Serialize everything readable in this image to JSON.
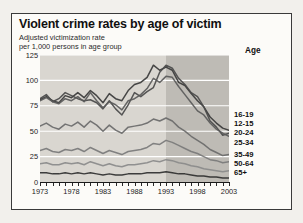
{
  "figure": {
    "title": "Violent crime rates by age of victim",
    "subtitle_line1": "Adjusted victimization rate",
    "subtitle_line2": "per 1,000 persons in age group",
    "legend_title": "Age"
  },
  "chart_data": {
    "type": "line",
    "title": "Violent crime rates by age of victim",
    "subtitle": "Adjusted victimization rate per 1,000 persons in age group",
    "xlabel": "",
    "ylabel": "Adjusted victimization rate per 1,000 persons in age group",
    "xlim": [
      1973,
      2003
    ],
    "ylim": [
      0,
      125
    ],
    "yticks": [
      0,
      25,
      50,
      75,
      100,
      125
    ],
    "xticks": [
      1973,
      1978,
      1983,
      1988,
      1993,
      1998,
      2003
    ],
    "xtick_labels": [
      "1973",
      "1978",
      "1983",
      "1988",
      "1993",
      "1998",
      "2003"
    ],
    "ytick_labels": [
      "0",
      "25",
      "50",
      "75",
      "100",
      "125"
    ],
    "grid": true,
    "grid_color": "#ffffff",
    "legend_position": "right",
    "legend_title": "Age",
    "plot_background": "#d9d6d0",
    "shaded_region": {
      "from": 1993,
      "to": 2003,
      "color": "#b9b6b0"
    },
    "x": [
      1973,
      1974,
      1975,
      1976,
      1977,
      1978,
      1979,
      1980,
      1981,
      1982,
      1983,
      1984,
      1985,
      1986,
      1987,
      1988,
      1989,
      1990,
      1991,
      1992,
      1993,
      1994,
      1995,
      1996,
      1997,
      1998,
      1999,
      2000,
      2001,
      2002,
      2003
    ],
    "series": [
      {
        "name": "16-19",
        "color": "#3a3a3a",
        "values": [
          81,
          84,
          80,
          78,
          85,
          83,
          88,
          83,
          90,
          85,
          78,
          87,
          82,
          80,
          90,
          96,
          98,
          103,
          115,
          110,
          113,
          110,
          98,
          95,
          87,
          80,
          74,
          64,
          58,
          53,
          51
        ]
      },
      {
        "name": "12-15",
        "color": "#4a4a4a",
        "values": [
          82,
          86,
          79,
          82,
          88,
          85,
          82,
          80,
          81,
          78,
          72,
          80,
          72,
          66,
          76,
          88,
          84,
          89,
          93,
          108,
          115,
          112,
          102,
          96,
          88,
          84,
          74,
          60,
          54,
          46,
          48
        ]
      },
      {
        "name": "20-24",
        "color": "#5a5a5a",
        "values": [
          80,
          83,
          79,
          77,
          82,
          80,
          84,
          79,
          88,
          80,
          73,
          79,
          76,
          71,
          80,
          82,
          86,
          92,
          102,
          98,
          104,
          103,
          94,
          86,
          78,
          70,
          66,
          58,
          52,
          48,
          45
        ]
      },
      {
        "name": "25-34",
        "color": "#6a6a6a",
        "values": [
          55,
          58,
          54,
          52,
          57,
          55,
          59,
          54,
          60,
          56,
          50,
          56,
          51,
          48,
          54,
          55,
          56,
          58,
          62,
          60,
          63,
          60,
          54,
          50,
          45,
          41,
          37,
          32,
          29,
          26,
          27
        ]
      },
      {
        "name": "35-49",
        "color": "#7a7a7a",
        "values": [
          31,
          33,
          30,
          29,
          32,
          31,
          33,
          30,
          34,
          31,
          28,
          31,
          29,
          27,
          30,
          31,
          32,
          34,
          38,
          37,
          41,
          39,
          36,
          33,
          30,
          28,
          25,
          22,
          21,
          19,
          20
        ]
      },
      {
        "name": "50-64",
        "color": "#8a8a8a",
        "values": [
          18,
          19,
          17,
          17,
          19,
          18,
          19,
          17,
          20,
          18,
          16,
          18,
          16,
          15,
          17,
          17,
          18,
          19,
          21,
          20,
          22,
          21,
          19,
          18,
          16,
          15,
          13,
          12,
          11,
          10,
          11
        ]
      },
      {
        "name": "65+",
        "color": "#2f2f2f",
        "values": [
          9,
          9,
          8,
          8,
          9,
          8,
          9,
          8,
          9,
          8,
          7,
          8,
          7,
          7,
          8,
          8,
          8,
          9,
          9,
          9,
          10,
          9,
          8,
          8,
          7,
          6,
          6,
          5,
          5,
          4,
          4
        ]
      }
    ],
    "legend_entries": [
      "16-19",
      "12-15",
      "20-24",
      "25-34",
      "35-49",
      "50-64",
      "65+"
    ]
  }
}
